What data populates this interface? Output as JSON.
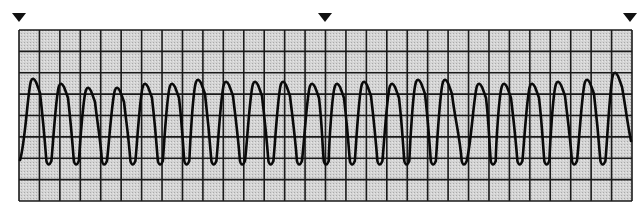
{
  "figure": {
    "description": "ECG rhythm strip showing a regular wide-complex tachycardia (sine-wave like ventricular tachycardia)",
    "colors": {
      "paper": "#cfcfcf",
      "grid": "#1a1a1a",
      "trace": "#0a0a0a",
      "background": "#ffffff",
      "marker": "#111111"
    }
  },
  "markers": [
    {
      "name": "time-marker-left",
      "x": 19
    },
    {
      "name": "time-marker-middle",
      "x": 325
    },
    {
      "name": "time-marker-right",
      "x": 630
    }
  ],
  "grid": {
    "left": 19,
    "top": 30,
    "right": 632,
    "bottom": 201,
    "columns": 30,
    "rows": 8
  },
  "waveform": {
    "baseline_start": {
      "x": 20,
      "y": 160
    },
    "end": {
      "x": 631,
      "y": 141
    },
    "peaks_x": [
      33,
      61,
      88,
      117,
      145,
      172,
      198,
      226,
      255,
      283,
      312,
      337,
      364,
      392,
      418,
      445,
      479,
      504,
      532,
      558,
      587,
      615
    ],
    "peak_y": [
      79,
      84,
      88,
      88,
      84,
      84,
      80,
      82,
      82,
      82,
      84,
      84,
      82,
      84,
      80,
      80,
      84,
      84,
      84,
      82,
      80,
      73
    ],
    "trough_y": 165
  }
}
